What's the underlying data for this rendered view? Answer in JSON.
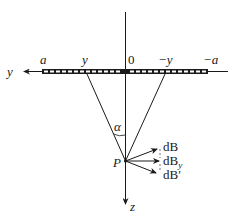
{
  "diagram": {
    "type": "physics-geometry",
    "axes": {
      "horizontal": {
        "label": "y",
        "direction": "left"
      },
      "vertical": {
        "label": "z",
        "direction": "down"
      }
    },
    "strip_labels": {
      "left_end": "a",
      "left_point": "y",
      "origin": "0",
      "right_point": "−y",
      "right_end": "−a"
    },
    "point_label": "P",
    "angle_label": "α",
    "vectors": [
      {
        "id": "dB",
        "label": "dB"
      },
      {
        "id": "dBy",
        "label_main": "dB",
        "label_sub": "y"
      },
      {
        "id": "dBprime",
        "label": "dB′"
      }
    ],
    "colors": {
      "ink": "#1a1a1a",
      "background": "#ffffff"
    }
  }
}
